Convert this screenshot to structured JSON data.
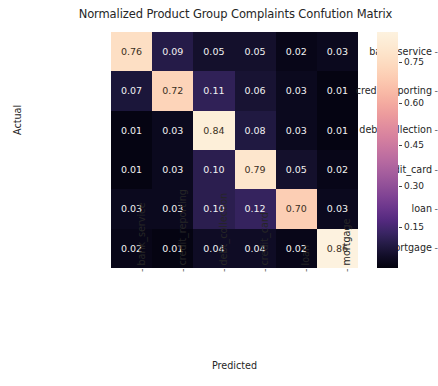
{
  "chart_data": {
    "type": "heatmap",
    "title": "Normalized Product Group Complaints Confution Matrix",
    "xlabel": "Predicted",
    "ylabel": "Actual",
    "categories_x": [
      "bank_service",
      "credit_reporting",
      "debt_collection",
      "credit_card",
      "loan",
      "mortgage"
    ],
    "categories_y": [
      "bank_service",
      "credit_reporting",
      "debt_collection",
      "credit_card",
      "loan",
      "mortgage"
    ],
    "rows": [
      {
        "label": "bank_service",
        "values": [
          0.76,
          0.09,
          0.05,
          0.05,
          0.02,
          0.03
        ]
      },
      {
        "label": "credit_reporting",
        "values": [
          0.07,
          0.72,
          0.11,
          0.06,
          0.03,
          0.01
        ]
      },
      {
        "label": "debt_collection",
        "values": [
          0.01,
          0.03,
          0.84,
          0.08,
          0.03,
          0.01
        ]
      },
      {
        "label": "credit_card",
        "values": [
          0.01,
          0.03,
          0.1,
          0.79,
          0.05,
          0.02
        ]
      },
      {
        "label": "loan",
        "values": [
          0.03,
          0.03,
          0.1,
          0.12,
          0.7,
          0.03
        ]
      },
      {
        "label": "mortgage",
        "values": [
          0.02,
          0.01,
          0.04,
          0.04,
          0.02,
          0.86
        ]
      }
    ],
    "cell_text": [
      [
        "0.76",
        "0.09",
        "0.05",
        "0.05",
        "0.02",
        "0.03"
      ],
      [
        "0.07",
        "0.72",
        "0.11",
        "0.06",
        "0.03",
        "0.01"
      ],
      [
        "0.01",
        "0.03",
        "0.84",
        "0.08",
        "0.03",
        "0.01"
      ],
      [
        "0.01",
        "0.03",
        "0.10",
        "0.79",
        "0.05",
        "0.02"
      ],
      [
        "0.03",
        "0.03",
        "0.10",
        "0.12",
        "0.70",
        "0.03"
      ],
      [
        "0.02",
        "0.01",
        "0.04",
        "0.04",
        "0.02",
        "0.86"
      ]
    ],
    "colormap": "magma",
    "colorbar": {
      "ticks": [
        "0.75",
        "0.60",
        "0.45",
        "0.30",
        "0.15"
      ],
      "tick_values": [
        0.75,
        0.6,
        0.45,
        0.3,
        0.15
      ],
      "vmin": 0.0,
      "vmax": 0.86,
      "position": "right"
    },
    "grid": false,
    "annotations": true
  },
  "colors": {
    "text": "#262626",
    "cell_text_dark": "#3b2f22",
    "cell_text_light": "#f2f2f2",
    "background": "#ffffff"
  }
}
